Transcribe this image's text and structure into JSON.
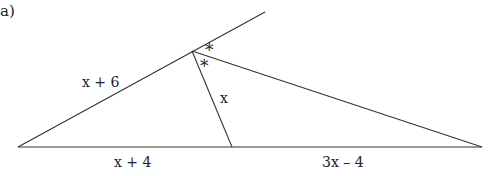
{
  "part_label": "a)",
  "diagram": {
    "line_color": "#333333",
    "vertices": {
      "bottom_left": [
        18,
        147
      ],
      "apex": [
        192,
        51
      ],
      "extension_end": [
        265,
        12
      ],
      "foot": [
        232,
        147
      ],
      "bottom_right": [
        482,
        147
      ]
    },
    "labels": {
      "left_side": "x + 6",
      "bisector": "x",
      "base_left": "x + 4",
      "base_right": "3x – 4",
      "angle_mark_1": "*",
      "angle_mark_2": "*"
    }
  }
}
